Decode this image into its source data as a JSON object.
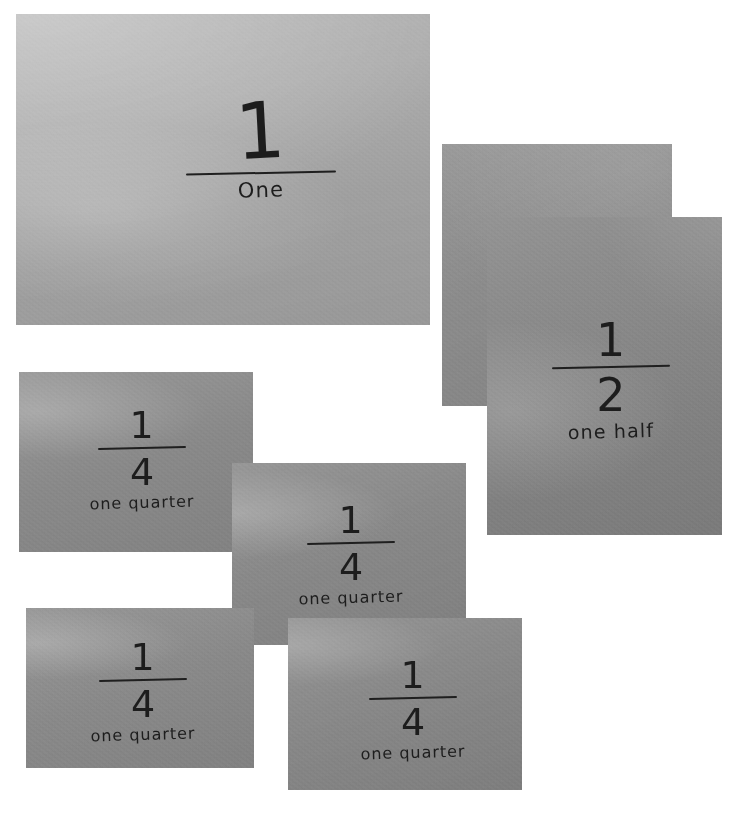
{
  "scene": {
    "title": "Handwritten fraction cards photograph",
    "background_color": "#ffffff",
    "width": 738,
    "height": 814
  },
  "cards": [
    {
      "id": "one",
      "name": "card-one",
      "numerator": "1",
      "denominator": "",
      "label": "One",
      "has_fraction_bar": true,
      "paper_color": "#a9a9a9",
      "ink_color": "#1d1d1d"
    },
    {
      "id": "half-back",
      "name": "card-half-back",
      "numerator": "",
      "denominator": "",
      "label": "",
      "has_fraction_bar": false,
      "paper_color": "#8f8f8f",
      "ink_color": "#1d1d1d"
    },
    {
      "id": "half",
      "name": "card-half",
      "numerator": "1",
      "denominator": "2",
      "label": "one half",
      "has_fraction_bar": true,
      "paper_color": "#8b8b8b",
      "ink_color": "#1d1d1d"
    },
    {
      "id": "quarter-1",
      "name": "card-quarter-1",
      "numerator": "1",
      "denominator": "4",
      "label": "one quarter",
      "has_fraction_bar": true,
      "paper_color": "#8e8e8e",
      "ink_color": "#1d1d1d"
    },
    {
      "id": "quarter-2",
      "name": "card-quarter-2",
      "numerator": "1",
      "denominator": "4",
      "label": "one quarter",
      "has_fraction_bar": true,
      "paper_color": "#8d8d8d",
      "ink_color": "#1d1d1d"
    },
    {
      "id": "quarter-3",
      "name": "card-quarter-3",
      "numerator": "1",
      "denominator": "4",
      "label": "one quarter",
      "has_fraction_bar": true,
      "paper_color": "#8e8e8e",
      "ink_color": "#1d1d1d"
    },
    {
      "id": "quarter-4",
      "name": "card-quarter-4",
      "numerator": "1",
      "denominator": "4",
      "label": "one quarter",
      "has_fraction_bar": true,
      "paper_color": "#8c8c8c",
      "ink_color": "#1d1d1d"
    }
  ]
}
